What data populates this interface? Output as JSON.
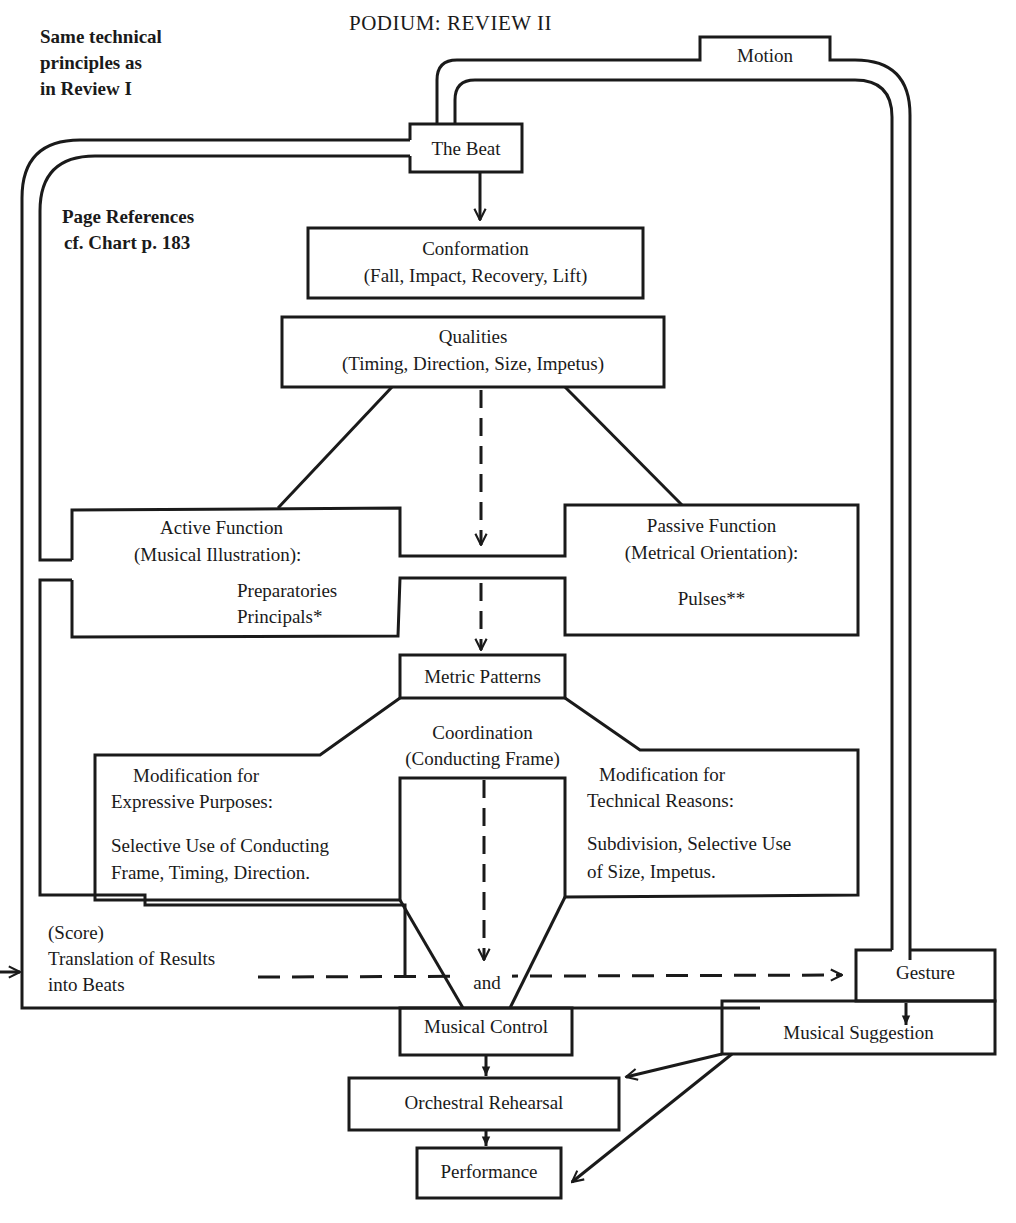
{
  "title": "PODIUM:  REVIEW  II",
  "notes": {
    "principles": [
      "Same technical",
      "principles as",
      "in Review I"
    ],
    "page_refs": [
      "Page References",
      "cf. Chart p. 183"
    ]
  },
  "nodes": {
    "motion": "Motion",
    "beat": "The Beat",
    "conformation": {
      "title": "Conformation",
      "detail": "(Fall, Impact, Recovery, Lift)"
    },
    "qualities": {
      "title": "Qualities",
      "detail": "(Timing, Direction, Size, Impetus)"
    },
    "active": {
      "title": "Active Function",
      "subtitle": "(Musical Illustration):",
      "items": [
        "Preparatories",
        "Principals*"
      ]
    },
    "passive": {
      "title": "Passive Function",
      "subtitle": "(Metrical Orientation):",
      "items": [
        "Pulses**"
      ]
    },
    "metric_patterns": "Metric Patterns",
    "coordination": {
      "title": "Coordination",
      "detail": "(Conducting Frame)"
    },
    "mod_expressive": {
      "title": "Modification for",
      "subtitle": "Expressive Purposes:",
      "lines": [
        "Selective Use  of Conducting",
        "Frame, Timing,   Direction."
      ]
    },
    "mod_technical": {
      "title": "Modification for",
      "subtitle": "Technical Reasons:",
      "lines": [
        "Subdivision,  Selective Use",
        "of Size,   Impetus."
      ]
    },
    "translation": [
      "(Score)",
      "Translation of Results",
      "into Beats"
    ],
    "and": "and",
    "gesture": "Gesture",
    "musical_control": "Musical Control",
    "musical_suggestion": "Musical Suggestion",
    "orchestral_rehearsal": "Orchestral Rehearsal",
    "performance": "Performance"
  },
  "colors": {
    "ink": "#1a1a1a",
    "paper": "#ffffff"
  }
}
